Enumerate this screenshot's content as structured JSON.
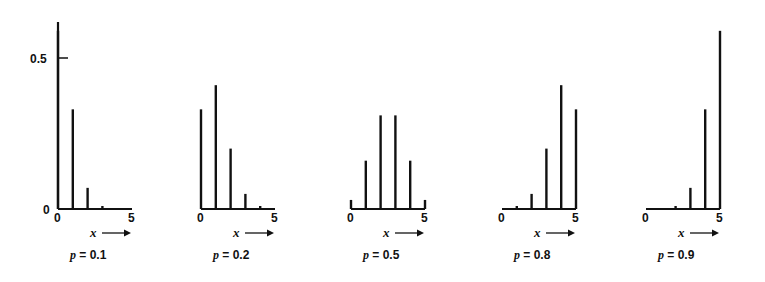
{
  "chart_data": {
    "type": "bar",
    "title": "",
    "n": 5,
    "categories": [
      0,
      1,
      2,
      3,
      4,
      5
    ],
    "xlabel": "x →",
    "ylabel": "",
    "ylim": [
      0,
      0.6
    ],
    "y_ticks": [
      0,
      0.5
    ],
    "y_tick_labels": [
      "0",
      "0.5"
    ],
    "x_tick_labels": [
      "0",
      "5"
    ],
    "grid": false,
    "legend": null,
    "series": [
      {
        "name": "p = 0.1",
        "p_symbol": "p",
        "p_value": "0.1",
        "values": [
          0.59,
          0.33,
          0.07,
          0.01,
          0.0,
          0.0
        ]
      },
      {
        "name": "p = 0.2",
        "p_symbol": "p",
        "p_value": "0.2",
        "values": [
          0.33,
          0.41,
          0.2,
          0.05,
          0.01,
          0.0
        ]
      },
      {
        "name": "p = 0.5",
        "p_symbol": "p",
        "p_value": "0.5",
        "values": [
          0.03,
          0.16,
          0.31,
          0.31,
          0.16,
          0.03
        ]
      },
      {
        "name": "p = 0.8",
        "p_symbol": "p",
        "p_value": "0.8",
        "values": [
          0.0,
          0.01,
          0.05,
          0.2,
          0.41,
          0.33
        ]
      },
      {
        "name": "p = 0.9",
        "p_symbol": "p",
        "p_value": "0.9",
        "values": [
          0.0,
          0.0,
          0.01,
          0.07,
          0.33,
          0.59
        ]
      }
    ]
  },
  "axes": {
    "y_tick_top": "0.5",
    "y_tick_zero": "0",
    "x_start": "0",
    "x_end": "5",
    "x_label": "x",
    "x_arrow": "→"
  }
}
